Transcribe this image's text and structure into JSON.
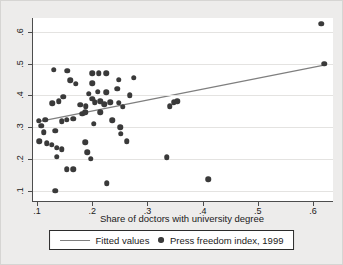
{
  "figure": {
    "type": "stata-scatter-figure",
    "background_color": "#edeceb",
    "plot_background_color": "#ffffff"
  },
  "colors": {
    "marker": "#3a3a3a",
    "fitted_line": "#7f7f7f",
    "grid": "#e4e3e1",
    "axis": "#4d4d4d",
    "text": "#1a1a1a",
    "legend_border": "#2b2b2b"
  },
  "chart_data": {
    "type": "scatter",
    "title": "",
    "xlabel": "Share of doctors with university degree",
    "ylabel": "",
    "x_range": [
      0.0928,
      0.636
    ],
    "y_range": [
      0.068,
      0.643
    ],
    "x_ticks": [
      {
        "value": 0.1,
        "label": ".1"
      },
      {
        "value": 0.2,
        "label": ".2"
      },
      {
        "value": 0.3,
        "label": ".3"
      },
      {
        "value": 0.4,
        "label": ".4"
      },
      {
        "value": 0.5,
        "label": ".5"
      },
      {
        "value": 0.6,
        "label": ".6"
      }
    ],
    "y_ticks": [
      {
        "value": 0.1,
        "label": ".1"
      },
      {
        "value": 0.2,
        "label": ".2"
      },
      {
        "value": 0.3,
        "label": ".3"
      },
      {
        "value": 0.4,
        "label": ".4"
      },
      {
        "value": 0.5,
        "label": ".5"
      },
      {
        "value": 0.6,
        "label": ".6"
      }
    ],
    "grid": "horizontal",
    "legend_position": "bottom-center",
    "series": [
      {
        "name": "Press freedom index, 1999",
        "type": "scatter",
        "marker": "filled-circle",
        "color": "#3a3a3a",
        "points": [
          [
            0.13,
            0.48
          ],
          [
            0.155,
            0.478
          ],
          [
            0.16,
            0.448
          ],
          [
            0.17,
            0.437
          ],
          [
            0.2,
            0.47
          ],
          [
            0.212,
            0.47
          ],
          [
            0.225,
            0.47
          ],
          [
            0.248,
            0.449
          ],
          [
            0.275,
            0.456
          ],
          [
            0.2,
            0.438
          ],
          [
            0.245,
            0.421
          ],
          [
            0.194,
            0.405
          ],
          [
            0.21,
            0.411
          ],
          [
            0.225,
            0.41
          ],
          [
            0.268,
            0.401
          ],
          [
            0.148,
            0.395
          ],
          [
            0.139,
            0.381
          ],
          [
            0.128,
            0.375
          ],
          [
            0.178,
            0.37
          ],
          [
            0.188,
            0.366
          ],
          [
            0.2,
            0.39
          ],
          [
            0.205,
            0.378
          ],
          [
            0.215,
            0.381
          ],
          [
            0.222,
            0.372
          ],
          [
            0.233,
            0.378
          ],
          [
            0.248,
            0.376
          ],
          [
            0.255,
            0.364
          ],
          [
            0.34,
            0.366
          ],
          [
            0.348,
            0.378
          ],
          [
            0.354,
            0.382
          ],
          [
            0.103,
            0.32
          ],
          [
            0.108,
            0.304
          ],
          [
            0.115,
            0.323
          ],
          [
            0.145,
            0.319
          ],
          [
            0.154,
            0.323
          ],
          [
            0.166,
            0.327
          ],
          [
            0.182,
            0.342
          ],
          [
            0.187,
            0.347
          ],
          [
            0.215,
            0.347
          ],
          [
            0.236,
            0.321
          ],
          [
            0.203,
            0.31
          ],
          [
            0.112,
            0.284
          ],
          [
            0.133,
            0.289
          ],
          [
            0.251,
            0.3
          ],
          [
            0.252,
            0.279
          ],
          [
            0.263,
            0.256
          ],
          [
            0.104,
            0.255
          ],
          [
            0.118,
            0.25
          ],
          [
            0.127,
            0.245
          ],
          [
            0.136,
            0.235
          ],
          [
            0.145,
            0.23
          ],
          [
            0.136,
            0.207
          ],
          [
            0.154,
            0.168
          ],
          [
            0.166,
            0.168
          ],
          [
            0.187,
            0.253
          ],
          [
            0.191,
            0.221
          ],
          [
            0.197,
            0.2
          ],
          [
            0.226,
            0.123
          ],
          [
            0.133,
            0.1
          ],
          [
            0.335,
            0.205
          ],
          [
            0.41,
            0.137
          ],
          [
            0.615,
            0.625
          ],
          [
            0.62,
            0.5
          ]
        ]
      },
      {
        "name": "Fitted values",
        "type": "line",
        "color": "#7f7f7f",
        "endpoints": [
          [
            0.105,
            0.318
          ],
          [
            0.62,
            0.495
          ]
        ]
      }
    ],
    "legend": {
      "entries": [
        {
          "label": "Fitted values",
          "swatch": "line"
        },
        {
          "label": "Press freedom index, 1999",
          "swatch": "dot"
        }
      ]
    }
  }
}
